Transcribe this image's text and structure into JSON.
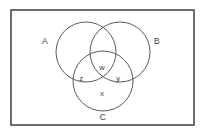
{
  "figure": {
    "name": "three-set-venn-diagram",
    "background_color": "#ffffff",
    "stroke_color": "#5a5a5a",
    "frame_color": "#4a4a4a",
    "text_color": "#3d3d3d"
  },
  "frame": {
    "x": 11,
    "y": 10,
    "width": 183,
    "height": 115
  },
  "circles": [
    {
      "id": "A",
      "cx": 86,
      "cy": 52,
      "r": 30
    },
    {
      "id": "B",
      "cx": 120,
      "cy": 52,
      "r": 30
    },
    {
      "id": "C",
      "cx": 103,
      "cy": 81,
      "r": 30
    }
  ],
  "set_labels": [
    {
      "id": "label-a",
      "text": "A",
      "x": 45,
      "y": 42
    },
    {
      "id": "label-b",
      "text": "B",
      "x": 157,
      "y": 42
    },
    {
      "id": "label-c",
      "text": "C",
      "x": 103,
      "y": 118
    }
  ],
  "region_labels": [
    {
      "id": "label-w",
      "text": "w",
      "x": 102,
      "y": 68
    },
    {
      "id": "label-z",
      "text": "z",
      "x": 81,
      "y": 79
    },
    {
      "id": "label-y",
      "text": "y",
      "x": 118,
      "y": 79
    },
    {
      "id": "label-x",
      "text": "x",
      "x": 102,
      "y": 94
    }
  ]
}
